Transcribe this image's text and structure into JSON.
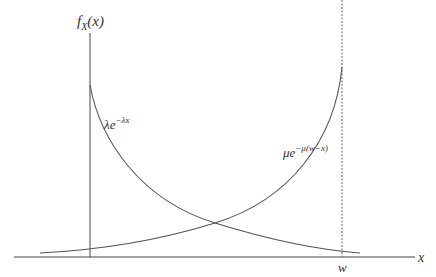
{
  "diagram": {
    "y_axis_label": "f_X(x)",
    "y_axis_label_main": "f",
    "y_axis_label_sub": "X",
    "y_axis_label_arg": "(x)",
    "x_axis_label": "x",
    "x_tick_label": "w",
    "curves": [
      {
        "name": "left-decay",
        "label_base": "λe",
        "label_exp": "−λx",
        "description": "decreasing exponential from x=0"
      },
      {
        "name": "right-growth",
        "label_base": "μe",
        "label_exp": "−μ(w−x)",
        "description": "increasing exponential toward x=w"
      }
    ],
    "colors": {
      "axis": "#333333",
      "curve": "#555555",
      "dashed": "#666666"
    }
  }
}
